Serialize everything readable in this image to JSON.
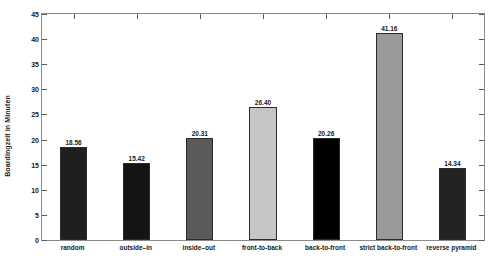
{
  "chart_data": {
    "type": "bar",
    "title": "",
    "subtitle": "",
    "xlabel": "",
    "ylabel": "Boardingzeit in Minuten",
    "categories": [
      "random",
      "outside–in",
      "inside–out",
      "front-to-back",
      "back-to-front",
      "strict back-to-front",
      "reverse pyramid"
    ],
    "values": [
      18.56,
      15.42,
      20.31,
      26.4,
      20.26,
      41.16,
      14.34
    ],
    "value_labels": [
      "18.56",
      "15.42",
      "20.31",
      "26.40",
      "20.26",
      "41.16",
      "14.34"
    ],
    "bar_colors": [
      "#1f1f1f",
      "#141414",
      "#5a5a5a",
      "#c6c6c6",
      "#000000",
      "#9a9a9a",
      "#232323"
    ],
    "bar_edge_color": "#2b2b2b",
    "ylim": [
      0,
      45
    ],
    "yticks": [
      0,
      5,
      10,
      15,
      20,
      25,
      30,
      35,
      40,
      45
    ],
    "ytick_labels": [
      "0",
      "5",
      "10",
      "15",
      "20",
      "25",
      "30",
      "35",
      "40",
      "45"
    ],
    "grid": false,
    "legend": null,
    "axis_color": "#8a8a8a"
  }
}
